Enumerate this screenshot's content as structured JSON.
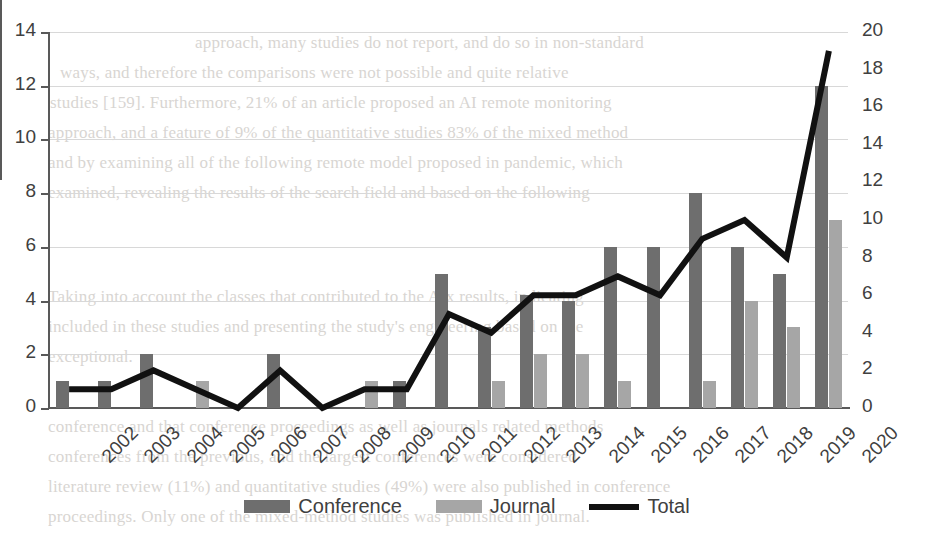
{
  "chart_data": {
    "type": "bar",
    "title": "",
    "subtitle": "",
    "xlabel": "",
    "ylabel": "",
    "grid": true,
    "legend_position": "bottom",
    "categories": [
      "2002",
      "2003",
      "2004",
      "2005",
      "2006",
      "2007",
      "2008",
      "2009",
      "2010",
      "2011",
      "2012",
      "2013",
      "2014",
      "2015",
      "2016",
      "2017",
      "2018",
      "2019",
      "2020"
    ],
    "series": [
      {
        "name": "Conference",
        "type": "bar",
        "axis": "left",
        "color": "#6e6e6e",
        "values": [
          1,
          1,
          2,
          0,
          0,
          2,
          0,
          0,
          1,
          5,
          3,
          4.2,
          4,
          6,
          6,
          8,
          6,
          5,
          12
        ]
      },
      {
        "name": "Journal",
        "type": "bar",
        "axis": "left",
        "color": "#a6a6a6",
        "values": [
          0,
          0,
          0,
          1,
          0,
          0,
          0,
          1,
          0,
          0,
          1,
          2,
          2,
          1,
          0,
          1,
          4,
          3,
          7
        ]
      },
      {
        "name": "Total",
        "type": "line",
        "axis": "right",
        "color": "#111111",
        "values": [
          1,
          1,
          2,
          1,
          0,
          2,
          0,
          1,
          1,
          5,
          4,
          6,
          6,
          7,
          6,
          9,
          10,
          8,
          19
        ]
      }
    ],
    "axes": {
      "left": {
        "min": 0,
        "max": 14,
        "step": 2,
        "ticks": [
          "0",
          "2",
          "4",
          "6",
          "8",
          "10",
          "12",
          "14"
        ]
      },
      "right": {
        "min": 0,
        "max": 20,
        "step": 2,
        "ticks": [
          "0",
          "2",
          "4",
          "6",
          "8",
          "10",
          "12",
          "14",
          "16",
          "18",
          "20"
        ]
      }
    }
  },
  "legend": {
    "items": [
      {
        "label": "Conference",
        "marker": "bar-swatch-dark"
      },
      {
        "label": "Journal",
        "marker": "bar-swatch-light"
      },
      {
        "label": "Total",
        "marker": "line-swatch-black"
      }
    ]
  },
  "background_text": {
    "lines": [
      "approach, many studies do not report, and do so in non-standard",
      "ways, and therefore the comparisons were not possible and quite relative",
      "studies [159]. Furthermore, 21% of an article proposed an AI remote monitoring",
      "approach, and a feature of 9% of the quantitative studies 83% of the mixed method",
      "and by examining all of the following remote model proposed in pandemic, which",
      "examined, revealing the results of the search field and based on the following",
      "Taking into account the classes that contributed to the AIx results, indicating",
      "included in these studies and presenting the study's engineering based on the",
      "exceptional.",
      "conference and that conference proceedings as well as journals related methods",
      "conferences from the previous, and the largest conferences were considered",
      "literature review (11%) and quantitative studies (49%) were also published in conference",
      "proceedings. Only one of the mixed-method studies was published in journal."
    ]
  }
}
